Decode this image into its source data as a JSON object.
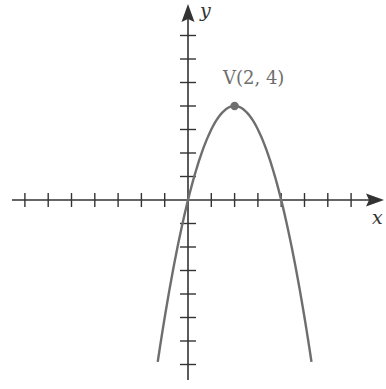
{
  "chart_data": {
    "type": "line",
    "title": "",
    "function": "y = -x^2 + 4x",
    "xlabel": "x",
    "ylabel": "y",
    "grid": false,
    "xlim": [
      -7.5,
      8.4
    ],
    "ylim": [
      -7.6,
      8.2
    ],
    "x_ticks": [
      -7,
      -6,
      -5,
      -4,
      -3,
      -2,
      -1,
      1,
      2,
      3,
      4,
      5,
      6,
      7
    ],
    "y_ticks": [
      -7,
      -6,
      -5,
      -4,
      -3,
      -2,
      -1,
      1,
      2,
      3,
      4,
      5,
      6,
      7
    ],
    "tick_labels_shown": false,
    "series": [
      {
        "name": "parabola",
        "color": "#6e6e6e",
        "x": [
          -1.3,
          -1,
          0,
          1,
          2,
          3,
          4,
          5,
          5.3
        ],
        "y": [
          -6.89,
          -5,
          0,
          3,
          4,
          3,
          0,
          -5,
          -6.89
        ]
      }
    ],
    "annotations": [
      {
        "text": "V(2, 4)",
        "x": 2,
        "y": 4,
        "marker": "point",
        "color": "#6e6e6e"
      }
    ]
  },
  "labels": {
    "x_axis": "x",
    "y_axis": "y",
    "vertex": "V(2, 4)"
  },
  "colors": {
    "axes": "#333333",
    "curve": "#6e6e6e"
  }
}
